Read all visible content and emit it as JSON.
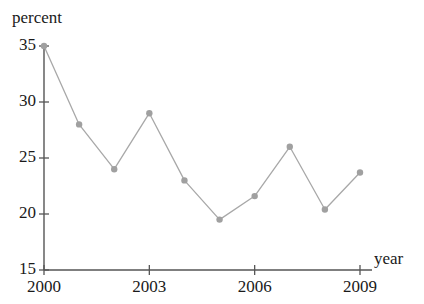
{
  "chart_data": {
    "type": "line",
    "title": "",
    "xlabel": "year",
    "ylabel": "percent",
    "x": [
      2000,
      2001,
      2002,
      2003,
      2004,
      2005,
      2006,
      2007,
      2008,
      2009
    ],
    "values": [
      35,
      28,
      24,
      29,
      23,
      19.5,
      21.6,
      26,
      20.4,
      23.7
    ],
    "series": [
      {
        "name": "percent",
        "values": [
          35,
          28,
          24,
          29,
          23,
          19.5,
          21.6,
          26,
          20.4,
          23.7
        ]
      }
    ],
    "xlim": [
      2000,
      2009
    ],
    "ylim": [
      15,
      35
    ],
    "yticks": [
      15,
      20,
      25,
      30,
      35
    ],
    "ytick_labels": [
      "15",
      "20",
      "25",
      "30",
      "35"
    ],
    "xticks": [
      2000,
      2003,
      2006,
      2009
    ],
    "xtick_labels": [
      "2000",
      "2003",
      "2006",
      "2009"
    ],
    "grid": false,
    "legend": false,
    "line_color": "#a8a8a8",
    "marker_color": "#a0a0a0",
    "axis_color": "#555555",
    "marker": "circle"
  }
}
